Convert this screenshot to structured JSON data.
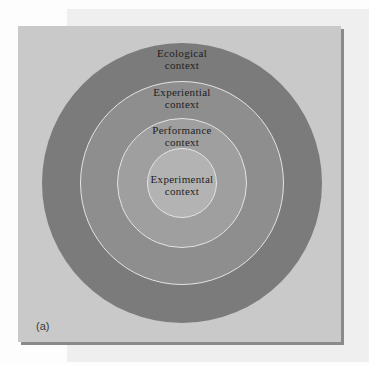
{
  "diagram": {
    "panel_label": "(a)",
    "rings": [
      {
        "id": "ecological",
        "line1": "Ecological",
        "line2": "context",
        "color": "#7b7b7b"
      },
      {
        "id": "experiential",
        "line1": "Experiential",
        "line2": "context",
        "color": "#8e8e8e"
      },
      {
        "id": "performance",
        "line1": "Performance",
        "line2": "context",
        "color": "#9f9f9f"
      },
      {
        "id": "experimental",
        "line1": "Experimental",
        "line2": "context",
        "color": "#b3b3b3"
      }
    ],
    "colors": {
      "panel_background": "#c9c9c9",
      "back_panel": "#efefef",
      "ring_separator": "#e4e4e4",
      "shadow": "#8a8a8a"
    }
  }
}
